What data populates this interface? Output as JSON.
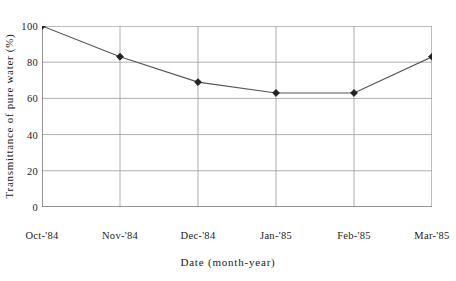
{
  "chart_data": {
    "type": "line",
    "title": "",
    "xlabel": "Date (month-year)",
    "ylabel": "Transmittance of pure water (%)",
    "categories": [
      "Oct-'84",
      "Nov-'84",
      "Dec-'84",
      "Jan-'85",
      "Feb-'85",
      "Mar-'85"
    ],
    "values": [
      100,
      83,
      69,
      63,
      63,
      83
    ],
    "series": [
      {
        "name": "Transmittance of pure water",
        "values": [
          100,
          83,
          69,
          63,
          63,
          83
        ]
      }
    ],
    "ylim": [
      0,
      100
    ],
    "yticks": [
      0,
      20,
      40,
      60,
      80,
      100
    ],
    "ytick_labels": [
      "0",
      "20",
      "40",
      "60",
      "80",
      "100"
    ],
    "grid": "both",
    "legend": "none",
    "marker": "filled-diamond",
    "line_color": "#555555",
    "marker_color": "#222222",
    "grid_color": "#9a9a9a",
    "axis_color": "#555555",
    "background": "#ffffff"
  }
}
